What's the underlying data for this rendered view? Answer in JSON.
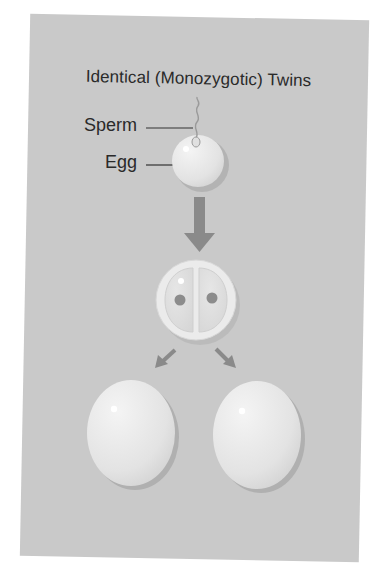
{
  "figure": {
    "title": "Identical (Monozygotic) Twins",
    "labels": {
      "sperm": "Sperm",
      "egg": "Egg"
    },
    "stages": [
      {
        "name": "fertilized-egg",
        "description": "Sperm entering egg"
      },
      {
        "name": "two-cell-embryo",
        "description": "Single zygote splitting into two cells"
      },
      {
        "name": "twin-embryos",
        "description": "Two identical embryos"
      }
    ],
    "colors": {
      "background": "#c9c9c9",
      "cell_fill": "#e8e8e8",
      "arrow": "#8a8a8a",
      "nucleus": "#8c8c8c",
      "text": "#2a2a2a"
    }
  }
}
